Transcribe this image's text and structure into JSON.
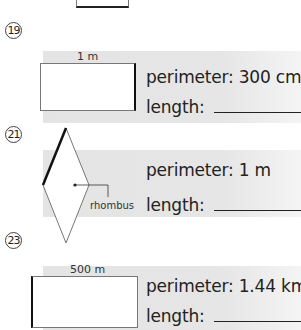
{
  "worksheet": {
    "problems": [
      {
        "number": "19",
        "shape": "rectangle",
        "dimension_label": "1 m",
        "bold_side": "right",
        "perimeter_text": "perimeter: 300 cm",
        "length_text": "length:",
        "answer_value": ""
      },
      {
        "number": "21",
        "shape": "rhombus",
        "shape_label": "rhombus",
        "bold_side": "upper-left",
        "perimeter_text": "perimeter: 1 m",
        "length_text": "length:",
        "answer_value": ""
      },
      {
        "number": "23",
        "shape": "rectangle",
        "dimension_label": "500 m",
        "bold_side": "left",
        "perimeter_text": "perimeter: 1.44 km",
        "length_text": "length:",
        "answer_value": ""
      }
    ]
  }
}
